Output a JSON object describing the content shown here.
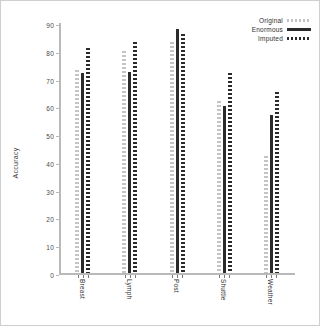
{
  "chart_data": {
    "type": "bar",
    "title": "",
    "xlabel": "",
    "ylabel": "Accuracy",
    "ylim": [
      0,
      90
    ],
    "yticks": [
      0,
      10,
      20,
      30,
      40,
      50,
      60,
      70,
      80,
      90
    ],
    "grid": false,
    "legend_position": "top-right",
    "categories": [
      "Breast",
      "Lymph",
      "Post",
      "Shuttle",
      "Weather"
    ],
    "series": [
      {
        "name": "Original",
        "style": "dotted-light",
        "color": "#c4c4c4",
        "values": [
          73,
          80,
          83,
          62,
          42
        ]
      },
      {
        "name": "Enormous",
        "style": "solid",
        "color": "#2b2b2b",
        "values": [
          72,
          72.5,
          88,
          60,
          57
        ]
      },
      {
        "name": "Imputed",
        "style": "dotted-dark",
        "color": "#2b2b2b",
        "values": [
          81,
          83,
          86,
          72,
          65
        ]
      }
    ]
  },
  "legend": {
    "entries": [
      {
        "label": "Original"
      },
      {
        "label": "Enormous"
      },
      {
        "label": "Imputed"
      }
    ]
  },
  "axes": {
    "y_title": "Accuracy"
  }
}
